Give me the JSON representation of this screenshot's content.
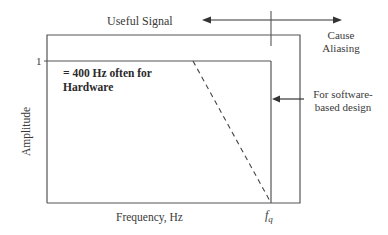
{
  "diagram": {
    "top_label": "Useful Signal",
    "aliasing_label_line1": "Cause",
    "aliasing_label_line2": "Aliasing",
    "amplitude_tick": "1",
    "hardware_note_line1": "= 400 Hz often for",
    "hardware_note_line2": "Hardware",
    "software_note_line1": "For software-",
    "software_note_line2": "based design",
    "y_axis_label": "Amplitude",
    "x_axis_label": "Frequency, Hz",
    "fq_label_base": "f",
    "fq_label_sub": "q"
  }
}
